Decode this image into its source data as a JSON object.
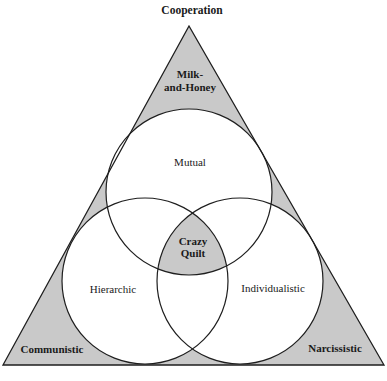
{
  "title": "Cooperation",
  "regions": {
    "apex": [
      "Milk-",
      "and-Honey"
    ],
    "center": [
      "Crazy",
      "Quilt"
    ],
    "bottom_left": "Communistic",
    "bottom_right": "Narcissistic"
  },
  "circles": {
    "top": "Mutual",
    "left": "Hierarchic",
    "right": "Individualistic"
  },
  "colors": {
    "shade": "#c9c9c9",
    "line": "#1e1e1e",
    "background": "#ffffff"
  }
}
